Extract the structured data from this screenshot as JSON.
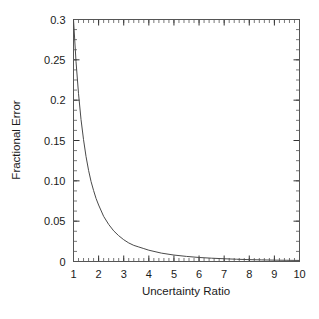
{
  "chart_data": {
    "type": "line",
    "title": "",
    "xlabel": "Uncertainty Ratio",
    "ylabel": "Fractional Error",
    "xlim": [
      1,
      10
    ],
    "ylim": [
      0,
      0.3
    ],
    "grid": false,
    "legend": null,
    "xticks": [
      1,
      2,
      3,
      4,
      5,
      6,
      7,
      8,
      9,
      10
    ],
    "xticklabels": [
      "1",
      "2",
      "3",
      "4",
      "5",
      "6",
      "7",
      "8",
      "9",
      "10"
    ],
    "yticks": [
      0,
      0.05,
      0.1,
      0.15,
      0.2,
      0.25,
      0.3
    ],
    "yticklabels": [
      "0",
      "0.05",
      "0.10",
      "0.15",
      "0.2",
      "0.25",
      "0.3"
    ],
    "x_minor_tick_interval": 0.2,
    "y_minor_tick_interval": 0.0125,
    "series": [
      {
        "name": "Fractional Error",
        "color": "#4a4a4a",
        "x": [
          1.0,
          1.1,
          1.2,
          1.3,
          1.4,
          1.5,
          1.6,
          1.7,
          1.8,
          1.9,
          2.0,
          2.2,
          2.4,
          2.6,
          2.8,
          3.0,
          3.2,
          3.4,
          3.6,
          3.8,
          4.0,
          4.5,
          5.0,
          5.5,
          6.0,
          6.5,
          7.0,
          7.5,
          8.0,
          8.5,
          9.0,
          9.5,
          10.0
        ],
        "y": [
          0.3,
          0.248,
          0.208,
          0.176,
          0.151,
          0.13,
          0.113,
          0.099,
          0.088,
          0.078,
          0.07,
          0.056,
          0.046,
          0.038,
          0.032,
          0.027,
          0.023,
          0.02,
          0.018,
          0.016,
          0.014,
          0.0104,
          0.008,
          0.0063,
          0.005,
          0.0041,
          0.0034,
          0.0028,
          0.0023,
          0.002,
          0.0017,
          0.0015,
          0.0013
        ]
      }
    ]
  },
  "axes": {
    "x_title": "Uncertainty Ratio",
    "y_title": "Fractional Error"
  }
}
